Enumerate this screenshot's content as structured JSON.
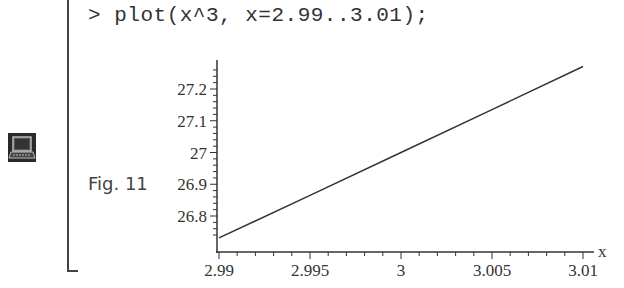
{
  "worksheet": {
    "prompt": ">",
    "command": "plot(x^3, x=2.99..3.01);",
    "figure_caption": "Fig. 11",
    "icon": "computer-terminal-icon"
  },
  "chart_data": {
    "type": "line",
    "title": "",
    "function": "x^3",
    "xlabel": "x",
    "ylabel": "",
    "xlim": [
      2.99,
      3.01
    ],
    "ylim": [
      26.73,
      27.27
    ],
    "x_ticks": [
      "2.99",
      "2.995",
      "3",
      "3.005",
      "3.01"
    ],
    "y_ticks": [
      "26.8",
      "26.9",
      "27",
      "27.1",
      "27.2"
    ],
    "series": [
      {
        "name": "x^3",
        "x": [
          2.99,
          2.995,
          3.0,
          3.005,
          3.01
        ],
        "values": [
          26.731,
          26.865,
          27.0,
          27.135,
          27.271
        ]
      }
    ],
    "grid": false,
    "legend": "none"
  }
}
